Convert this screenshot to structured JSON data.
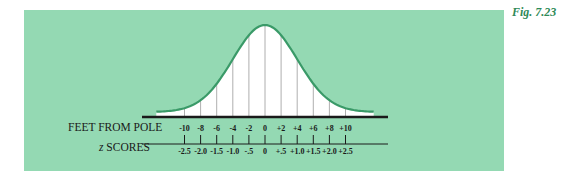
{
  "figure": {
    "label": "Fig. 7.23",
    "panel_color": "#94d9b3",
    "curve_color": "#3a9a68",
    "line_color": "#1a1a1a"
  },
  "axes": {
    "feet_label": "FEET FROM POLE",
    "z_label_italic": "z",
    "z_label_rest": " SCORES",
    "feet_ticks": [
      "-10",
      "-8",
      "-6",
      "-4",
      "-2",
      "0",
      "+2",
      "+4",
      "+6",
      "+8",
      "+10"
    ],
    "z_ticks": [
      "-2.5",
      "-2.0",
      "-1.5",
      "-1.0",
      "-.5",
      "0",
      "+.5",
      "+1.0",
      "+1.5",
      "+2.0",
      "+2.5"
    ]
  },
  "chart_data": {
    "type": "area",
    "title": "",
    "x_feet": [
      -10,
      -8,
      -6,
      -4,
      -2,
      0,
      2,
      4,
      6,
      8,
      10
    ],
    "x_z": [
      -2.5,
      -2.0,
      -1.5,
      -1.0,
      -0.5,
      0,
      0.5,
      1.0,
      1.5,
      2.0,
      2.5
    ],
    "xlabel_primary": "FEET FROM POLE",
    "xlabel_secondary": "z SCORES",
    "mean": 0,
    "sd_feet": 4,
    "grid": false,
    "legend": null
  }
}
